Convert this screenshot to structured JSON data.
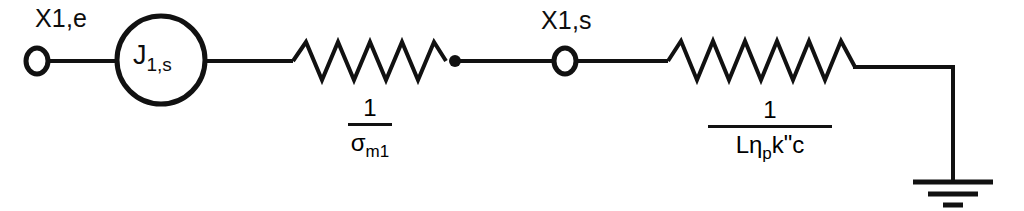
{
  "diagram": {
    "type": "equivalent-circuit",
    "nodes": {
      "input_terminal_label": "X1,e",
      "middle_node_label": "X1,s"
    },
    "source": {
      "symbol": "J",
      "subscript": "1,s",
      "full": "J1,s"
    },
    "element_1": {
      "kind": "spring-resistor",
      "numerator": "1",
      "denominator_base": "σ",
      "denominator_sub": "m1",
      "full": "1/σm1"
    },
    "element_2": {
      "kind": "spring-resistor",
      "numerator": "1",
      "denominator_prefix": "Lη",
      "denominator_sub": "p",
      "denominator_suffix": "k",
      "denominator_prime": "\"",
      "denominator_tail": "c",
      "full": "1/Lηpk\"c"
    },
    "ground": {
      "name": "ground-symbol",
      "bars": 3
    },
    "colors": {
      "line": "#111111",
      "text": "#0d0d0d",
      "background": "#ffffff"
    }
  }
}
